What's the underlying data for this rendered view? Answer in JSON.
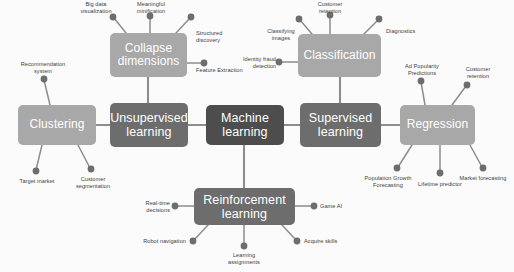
{
  "diagram": {
    "title": "Machine Learning",
    "type": "mind-map",
    "background_color": "#fbfbfb",
    "colors": {
      "core_node": "#4d4d4d",
      "branch_node": "#6d6d6d",
      "leaf_group_node": "#a8a8a8",
      "connector": "#8d8d8d",
      "leaf_dot": "#6d6d6d",
      "label_text": "#3d3d3d",
      "node_text": "#ffffff"
    },
    "nodes": {
      "machine_learning": "Machine\nlearning",
      "unsupervised_learning": "Unsupervised\nlearning",
      "supervised_learning": "Supervised\nlearning",
      "reinforcement_learning": "Reinforcement\nlearning",
      "clustering": "Clustering",
      "collapse_dimensions": "Collapse\ndimensions",
      "classification": "Classification",
      "regression": "Regression"
    },
    "leaves": {
      "clustering": [
        "Recommendation\nsystem",
        "Target market",
        "Customer\nsegmentation"
      ],
      "collapse_dimensions": [
        "Big data\nvisualization",
        "Meaningful\nminification",
        "Structured\ndiscovery",
        "Feature Extraction"
      ],
      "classification": [
        "Classifying\nimages",
        "Customer\nretention",
        "Diagnostics",
        "Identity fraud\ndetection"
      ],
      "regression": [
        "Ad Popularity\nPredictions",
        "Customer\nretention",
        "Market forecasting",
        "Lifetime predictor",
        "Population Growth\nForecasting"
      ],
      "reinforcement_learning": [
        "Real-time\ndecisions",
        "Game AI",
        "Robot navigation",
        "Learning\nassignments",
        "Acquire skills"
      ]
    }
  }
}
